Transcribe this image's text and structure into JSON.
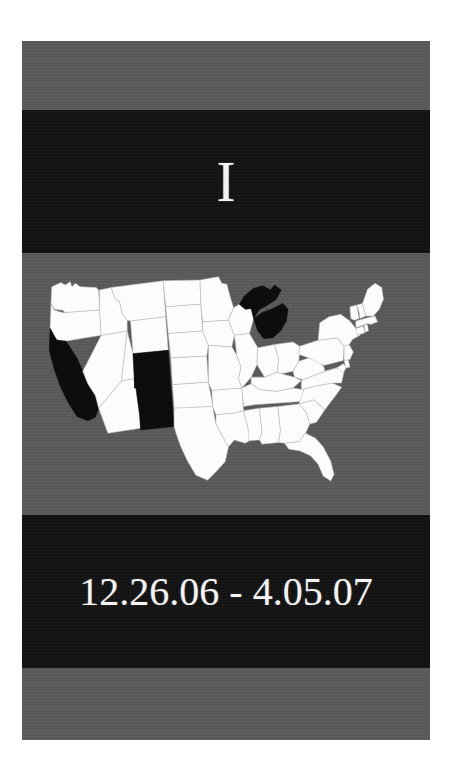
{
  "slide": {
    "title_letter": "I",
    "date_range": "12.26.06  -  4.05.07",
    "date_start": "12.26.06",
    "date_end": "4.05.07",
    "date_separator": "-"
  },
  "colors": {
    "page_background": "#ffffff",
    "band_gray": "#5a5a5a",
    "band_black": "#121212",
    "text_white": "#f2f2f2",
    "state_unhighlighted": "#fcfcfc",
    "state_highlighted": "#0d0d0d",
    "state_border": "#bdbdbd"
  },
  "map": {
    "region": "United States",
    "highlighted_states": [
      "California",
      "Colorado",
      "New Mexico",
      "Michigan"
    ],
    "states": [
      {
        "code": "WA",
        "name": "Washington",
        "highlighted": false
      },
      {
        "code": "OR",
        "name": "Oregon",
        "highlighted": false
      },
      {
        "code": "CA",
        "name": "California",
        "highlighted": true
      },
      {
        "code": "NV",
        "name": "Nevada",
        "highlighted": false
      },
      {
        "code": "ID",
        "name": "Idaho",
        "highlighted": false
      },
      {
        "code": "MT",
        "name": "Montana",
        "highlighted": false
      },
      {
        "code": "WY",
        "name": "Wyoming",
        "highlighted": false
      },
      {
        "code": "UT",
        "name": "Utah",
        "highlighted": false
      },
      {
        "code": "AZ",
        "name": "Arizona",
        "highlighted": false
      },
      {
        "code": "CO",
        "name": "Colorado",
        "highlighted": true
      },
      {
        "code": "NM",
        "name": "New Mexico",
        "highlighted": true
      },
      {
        "code": "ND",
        "name": "North Dakota",
        "highlighted": false
      },
      {
        "code": "SD",
        "name": "South Dakota",
        "highlighted": false
      },
      {
        "code": "NE",
        "name": "Nebraska",
        "highlighted": false
      },
      {
        "code": "KS",
        "name": "Kansas",
        "highlighted": false
      },
      {
        "code": "OK",
        "name": "Oklahoma",
        "highlighted": false
      },
      {
        "code": "TX",
        "name": "Texas",
        "highlighted": false
      },
      {
        "code": "MN",
        "name": "Minnesota",
        "highlighted": false
      },
      {
        "code": "IA",
        "name": "Iowa",
        "highlighted": false
      },
      {
        "code": "MO",
        "name": "Missouri",
        "highlighted": false
      },
      {
        "code": "AR",
        "name": "Arkansas",
        "highlighted": false
      },
      {
        "code": "LA",
        "name": "Louisiana",
        "highlighted": false
      },
      {
        "code": "WI",
        "name": "Wisconsin",
        "highlighted": false
      },
      {
        "code": "IL",
        "name": "Illinois",
        "highlighted": false
      },
      {
        "code": "MI",
        "name": "Michigan",
        "highlighted": true
      },
      {
        "code": "IN",
        "name": "Indiana",
        "highlighted": false
      },
      {
        "code": "OH",
        "name": "Ohio",
        "highlighted": false
      },
      {
        "code": "KY",
        "name": "Kentucky",
        "highlighted": false
      },
      {
        "code": "TN",
        "name": "Tennessee",
        "highlighted": false
      },
      {
        "code": "MS",
        "name": "Mississippi",
        "highlighted": false
      },
      {
        "code": "AL",
        "name": "Alabama",
        "highlighted": false
      },
      {
        "code": "GA",
        "name": "Georgia",
        "highlighted": false
      },
      {
        "code": "FL",
        "name": "Florida",
        "highlighted": false
      },
      {
        "code": "SC",
        "name": "South Carolina",
        "highlighted": false
      },
      {
        "code": "NC",
        "name": "North Carolina",
        "highlighted": false
      },
      {
        "code": "VA",
        "name": "Virginia",
        "highlighted": false
      },
      {
        "code": "WV",
        "name": "West Virginia",
        "highlighted": false
      },
      {
        "code": "MD",
        "name": "Maryland",
        "highlighted": false
      },
      {
        "code": "DE",
        "name": "Delaware",
        "highlighted": false
      },
      {
        "code": "PA",
        "name": "Pennsylvania",
        "highlighted": false
      },
      {
        "code": "NJ",
        "name": "New Jersey",
        "highlighted": false
      },
      {
        "code": "NY",
        "name": "New York",
        "highlighted": false
      },
      {
        "code": "CT",
        "name": "Connecticut",
        "highlighted": false
      },
      {
        "code": "RI",
        "name": "Rhode Island",
        "highlighted": false
      },
      {
        "code": "MA",
        "name": "Massachusetts",
        "highlighted": false
      },
      {
        "code": "VT",
        "name": "Vermont",
        "highlighted": false
      },
      {
        "code": "NH",
        "name": "New Hampshire",
        "highlighted": false
      },
      {
        "code": "ME",
        "name": "Maine",
        "highlighted": false
      }
    ]
  }
}
